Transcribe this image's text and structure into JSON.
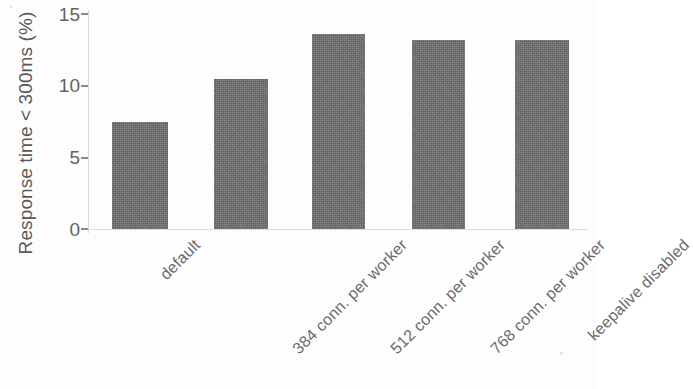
{
  "chart_data": {
    "type": "bar",
    "title": "",
    "subtitle": "",
    "xlabel": "",
    "ylabel": "Response time < 300ms (%)",
    "categories": [
      "default",
      "384 conn. per worker",
      "512 conn. per worker",
      "768 conn. per worker",
      "keepalive disabled"
    ],
    "values": [
      7.5,
      10.5,
      13.6,
      13.2,
      13.2
    ],
    "ylim": [
      0,
      15
    ],
    "yticks": [
      0,
      5,
      10,
      15
    ],
    "ytick_labels": [
      "0",
      "5",
      "10",
      "15"
    ],
    "grid": false,
    "legend": null,
    "legend_position": "none",
    "bar_color": "#6f6f6f",
    "axis_color": "#8a8a8a",
    "text_color": "#636363",
    "background": "#ffffff"
  },
  "axis": {
    "y_title": "Response time < 300ms (%)",
    "tick_labels": {
      "t15": "15",
      "t10": "10",
      "t5": "5",
      "t0": "0"
    }
  },
  "bars": [
    {
      "label": "default",
      "value": "7.5"
    },
    {
      "label": "384 conn. per worker",
      "value": "10.5"
    },
    {
      "label": "512 conn. per worker",
      "value": "13.6"
    },
    {
      "label": "768 conn. per worker",
      "value": "13.2"
    },
    {
      "label": "keepalive disabled",
      "value": "13.2"
    }
  ]
}
